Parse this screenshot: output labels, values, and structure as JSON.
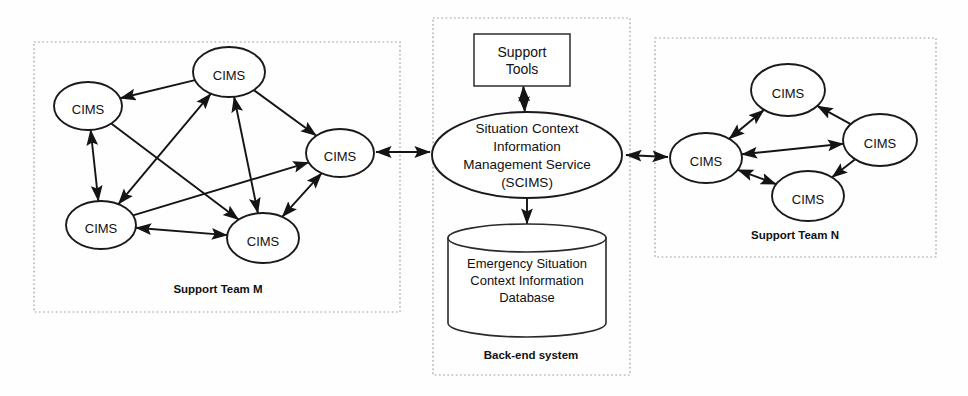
{
  "diagram": {
    "groups": [
      {
        "id": "support-team-m",
        "label": "Support Team M",
        "box": {
          "x": 34,
          "y": 42,
          "w": 366,
          "h": 270
        },
        "label_pos": {
          "x": 218,
          "y": 293
        },
        "nodes": [
          {
            "id": "m1",
            "label": "CIMS",
            "cx": 88,
            "cy": 106,
            "rx": 34,
            "ry": 24
          },
          {
            "id": "m2",
            "label": "CIMS",
            "cx": 229,
            "cy": 72,
            "rx": 36,
            "ry": 25
          },
          {
            "id": "m3",
            "label": "CIMS",
            "cx": 340,
            "cy": 153,
            "rx": 34,
            "ry": 24
          },
          {
            "id": "m4",
            "label": "CIMS",
            "cx": 101,
            "cy": 225,
            "rx": 35,
            "ry": 24
          },
          {
            "id": "m5",
            "label": "CIMS",
            "cx": 263,
            "cy": 238,
            "rx": 36,
            "ry": 25
          }
        ],
        "edges": [
          {
            "from": "m2",
            "to": "m1",
            "arrows": "to"
          },
          {
            "from": "m1",
            "to": "m4",
            "arrows": "both"
          },
          {
            "from": "m2",
            "to": "m4",
            "arrows": "both"
          },
          {
            "from": "m2",
            "to": "m3",
            "arrows": "to"
          },
          {
            "from": "m2",
            "to": "m5",
            "arrows": "both"
          },
          {
            "from": "m3",
            "to": "m5",
            "arrows": "both"
          },
          {
            "from": "m4",
            "to": "m5",
            "arrows": "both"
          },
          {
            "from": "m1",
            "to": "m5",
            "arrows": "to"
          },
          {
            "from": "m4",
            "to": "m3",
            "arrows": "to"
          }
        ]
      },
      {
        "id": "back-end-system",
        "label": "Back-end system",
        "box": {
          "x": 433,
          "y": 18,
          "w": 197,
          "h": 357
        },
        "label_pos": {
          "x": 531,
          "y": 359
        },
        "nodes": [
          {
            "id": "tools",
            "label": "Support Tools",
            "lines": [
              "Support",
              "Tools"
            ],
            "shape": "rect",
            "x": 474,
            "y": 34,
            "w": 96,
            "h": 52
          },
          {
            "id": "scims",
            "label": "Situation Context Information Management Service (SCIMS)",
            "lines": [
              "Situation Context",
              "Information",
              "Management Service",
              "(SCIMS)"
            ],
            "shape": "ellipse",
            "cx": 527,
            "cy": 155,
            "rx": 95,
            "ry": 43
          },
          {
            "id": "db",
            "label": "Emergency Situation Context Information Database",
            "lines": [
              "Emergency Situation",
              "Context Information",
              "Database"
            ],
            "shape": "cylinder",
            "x": 448,
            "y": 224,
            "w": 158,
            "h": 113,
            "ry": 14
          }
        ],
        "edges": [
          {
            "from": "tools",
            "to": "scims",
            "arrows": "both"
          },
          {
            "from": "scims",
            "to": "db",
            "arrows": "to"
          }
        ]
      },
      {
        "id": "support-team-n",
        "label": "Support Team N",
        "box": {
          "x": 655,
          "y": 38,
          "w": 281,
          "h": 219
        },
        "label_pos": {
          "x": 795,
          "y": 239
        },
        "nodes": [
          {
            "id": "n1",
            "label": "CIMS",
            "cx": 706,
            "cy": 158,
            "rx": 36,
            "ry": 25
          },
          {
            "id": "n2",
            "label": "CIMS",
            "cx": 788,
            "cy": 90,
            "rx": 37,
            "ry": 26
          },
          {
            "id": "n3",
            "label": "CIMS",
            "cx": 880,
            "cy": 140,
            "rx": 37,
            "ry": 26
          },
          {
            "id": "n4",
            "label": "CIMS",
            "cx": 808,
            "cy": 196,
            "rx": 36,
            "ry": 25
          }
        ],
        "edges": [
          {
            "from": "n1",
            "to": "n2",
            "arrows": "both"
          },
          {
            "from": "n1",
            "to": "n3",
            "arrows": "both"
          },
          {
            "from": "n1",
            "to": "n4",
            "arrows": "both"
          },
          {
            "from": "n3",
            "to": "n2",
            "arrows": "to"
          },
          {
            "from": "n3",
            "to": "n4",
            "arrows": "to"
          }
        ]
      }
    ],
    "inter_group_edges": [
      {
        "id": "m3-scims",
        "x1": 376,
        "y1": 152,
        "x2": 430,
        "y2": 152,
        "arrows": "both"
      },
      {
        "id": "scims-n1",
        "x1": 626,
        "y1": 155,
        "x2": 668,
        "y2": 157,
        "arrows": "both"
      }
    ],
    "colors": {
      "stroke": "#141414",
      "box_stroke": "#999999",
      "node_fill": "#ffffff",
      "background": "#fefefe",
      "text": "#111111"
    }
  }
}
